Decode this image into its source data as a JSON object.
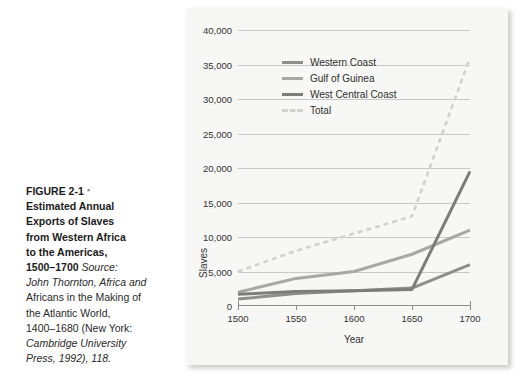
{
  "caption": {
    "figure_label": "FIGURE 2-1",
    "bullet": "▪",
    "title_lines": [
      "Estimated Annual",
      "Exports of Slaves",
      "from Western Africa",
      "to the Americas,",
      "1500–1700"
    ],
    "source_word": "Source:",
    "source_lines": [
      "John Thornton, Africa and",
      "Africans in the Making of",
      "the Atlantic World,",
      "1400–1680 (New York:",
      "Cambridge University",
      "Press, 1992), 118."
    ]
  },
  "chart_data": {
    "type": "line",
    "title": "",
    "xlabel": "Year",
    "ylabel": "Slaves",
    "x": [
      1500,
      1550,
      1600,
      1650,
      1700
    ],
    "xlim": [
      1500,
      1700
    ],
    "ylim": [
      0,
      40000
    ],
    "xticks": [
      1500,
      1550,
      1600,
      1650,
      1700
    ],
    "yticks": [
      0,
      5000,
      10000,
      15000,
      20000,
      25000,
      30000,
      35000,
      40000
    ],
    "ytick_labels": [
      "0",
      "5,000",
      "10,000",
      "15,000",
      "20,000",
      "25,000",
      "30,000",
      "35,000",
      "40,000"
    ],
    "grid": true,
    "legend_position": "upper-left-inside",
    "series": [
      {
        "name": "Western Coast",
        "color": "#8f8f8a",
        "style": "solid",
        "values": [
          1000,
          1800,
          2200,
          2600,
          6000
        ]
      },
      {
        "name": "Gulf of Guinea",
        "color": "#a8a8a2",
        "style": "solid",
        "values": [
          2000,
          4000,
          5000,
          7500,
          11000
        ]
      },
      {
        "name": "West Central Coast",
        "color": "#7d7d78",
        "style": "solid",
        "values": [
          1700,
          2100,
          2200,
          2400,
          19500
        ]
      },
      {
        "name": "Total",
        "color": "#d2d2cc",
        "style": "dashed",
        "values": [
          5000,
          8000,
          10500,
          13000,
          36000
        ]
      }
    ]
  },
  "colors": {
    "panel_background": "#f7f7f5",
    "page_background": "#ffffff",
    "gridline": "#c9c9c4",
    "axis": "#8d8d88",
    "text": "#2e2e2e"
  }
}
